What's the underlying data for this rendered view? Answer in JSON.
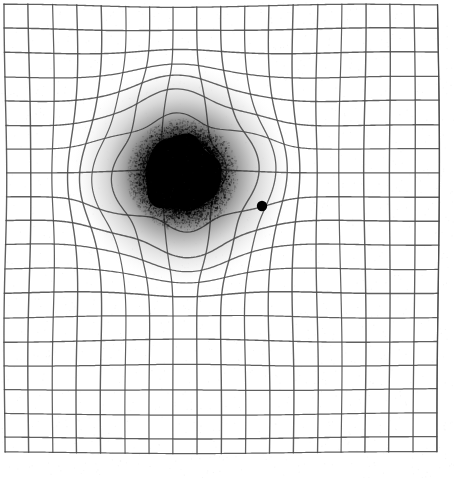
{
  "page": {
    "background_color": "#ffffff",
    "width": 454,
    "height": 478
  },
  "grid": {
    "name": "amsler-grid",
    "line_color": "#4a4a4a",
    "line_width": 1.15,
    "cell_size": 24,
    "origin_x": 5,
    "origin_y": 5,
    "columns": 18,
    "rows": 19,
    "right_edge": 437,
    "bottom_edge": 452
  },
  "scotoma": {
    "name": "central-scotoma-blob",
    "center_x": 182,
    "center_y": 174,
    "core_radius": 38,
    "halo_radius": 112,
    "core_color": "#000000",
    "halo_color": "#9a9a9a",
    "speckle_count": 2600
  },
  "distortion": {
    "name": "metamorphopsia-warp",
    "center_x": 182,
    "center_y": 174,
    "strength": 34,
    "falloff_radius": 120,
    "secondary_strength": 10,
    "secondary_radius": 200
  },
  "fixation_dot": {
    "name": "fixation-dot",
    "center_x": 262,
    "center_y": 206,
    "radius": 5.2,
    "color": "#000000"
  },
  "chart_data": {
    "type": "heatmap",
    "xlabel": "",
    "ylabel": "",
    "grid": true,
    "legend": "none",
    "xlim": [
      5,
      437
    ],
    "ylim": [
      5,
      452
    ],
    "annotations": [
      {
        "label": "central scotoma",
        "x": 182,
        "y": 174,
        "radius": 38
      },
      {
        "label": "fixation point",
        "x": 262,
        "y": 206,
        "radius": 5
      }
    ]
  }
}
